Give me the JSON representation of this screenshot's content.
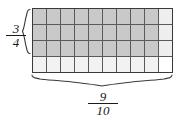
{
  "figure": {
    "kind": "area-model-fraction-multiplication",
    "grid": {
      "columns": 10,
      "rows": 4,
      "shaded_columns": 9,
      "shaded_rows": 3,
      "shaded_cells": 27,
      "total_cells": 40
    },
    "colors": {
      "shaded_fill": "#c9c9c9",
      "unshaded_fill": "#f2f2f2",
      "gridline": "#4a4a4a",
      "border": "#3a3a3a",
      "brace": "#3a3a3a",
      "text": "#1a1a1a",
      "background": "#ffffff"
    },
    "vertical_label": {
      "name": "vertical-fraction-label",
      "numerator": "3",
      "denominator": "4",
      "text": "3/4",
      "brace_spans_rows": 3
    },
    "horizontal_label": {
      "name": "horizontal-fraction-label",
      "numerator": "9",
      "denominator": "10",
      "text": "9/10",
      "brace_spans_columns": 9
    }
  }
}
